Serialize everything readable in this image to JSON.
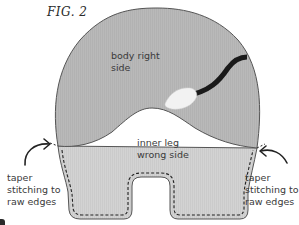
{
  "figure": {
    "label": "FIG. 2"
  },
  "regions": {
    "body": {
      "line1": "body right",
      "line2": "side",
      "color": "#b9b9b9"
    },
    "inner_leg": {
      "line1": "inner leg",
      "line2": "wrong side",
      "color": "#d2d2d2"
    }
  },
  "annotations": {
    "left": {
      "line1": "taper",
      "line2": "stitching to",
      "line3": "raw edges"
    },
    "right": {
      "line1": "taper",
      "line2": "stitching to",
      "line3": "raw edges"
    }
  },
  "elements": {
    "tail": {
      "color": "#1a1a1a"
    },
    "leaf": {
      "color": "#f2f2f2"
    },
    "stitch_line": {
      "style": "dashed",
      "color": "#222222"
    },
    "outline": {
      "color": "#555555"
    }
  }
}
